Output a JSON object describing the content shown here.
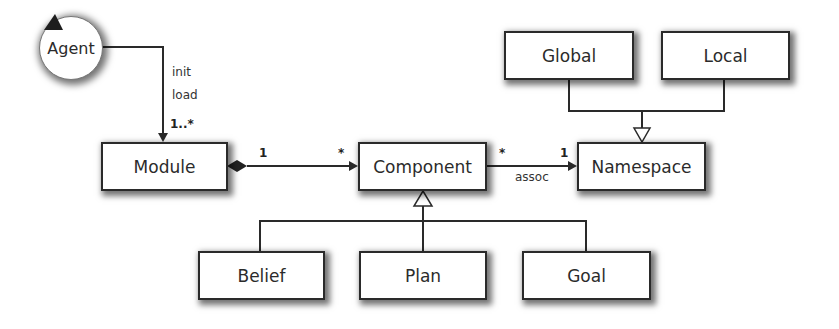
{
  "diagram": {
    "type": "uml-class-diagram",
    "nodes": {
      "agent": {
        "label": "Agent",
        "shape": "circle-actor"
      },
      "module": {
        "label": "Module"
      },
      "component": {
        "label": "Component"
      },
      "namespace": {
        "label": "Namespace"
      },
      "global": {
        "label": "Global"
      },
      "local": {
        "label": "Local"
      },
      "belief": {
        "label": "Belief"
      },
      "plan": {
        "label": "Plan"
      },
      "goal": {
        "label": "Goal"
      }
    },
    "edges": {
      "agent_module": {
        "from": "Agent",
        "to": "Module",
        "kind": "directed-association",
        "labels": [
          "init",
          "load"
        ],
        "label1": "init",
        "label2": "load",
        "target_multiplicity": "1..*"
      },
      "module_component": {
        "from": "Module",
        "to": "Component",
        "kind": "composition",
        "source_multiplicity": "1",
        "target_multiplicity": "*"
      },
      "component_namespace": {
        "from": "Component",
        "to": "Namespace",
        "kind": "directed-association",
        "label": "assoc",
        "source_multiplicity": "*",
        "target_multiplicity": "1"
      },
      "namespace_generalization": {
        "parent": "Namespace",
        "children": [
          "Global",
          "Local"
        ],
        "kind": "generalization"
      },
      "component_generalization": {
        "parent": "Component",
        "children": [
          "Belief",
          "Plan",
          "Goal"
        ],
        "kind": "generalization"
      }
    },
    "colors": {
      "line": "#2a2a2a",
      "box_fill": "#ffffff",
      "text": "#2b2b2b"
    }
  }
}
